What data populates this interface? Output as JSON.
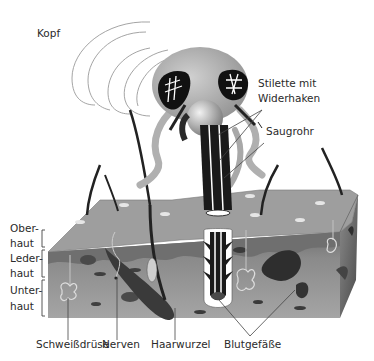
{
  "diagram": {
    "labels": {
      "head": "Kopf",
      "stylets": "Stilette mit Widerhaken",
      "stylets_line1": "Stilette mit",
      "stylets_line2": "Widerhaken",
      "proboscis": "Saugrohr",
      "epidermis_line1": "Ober-",
      "epidermis_line2": "haut",
      "dermis_line1": "Leder-",
      "dermis_line2": "haut",
      "subcutis_line1": "Unter-",
      "subcutis_line2": "haut",
      "sweat_gland": "Schweißdrüse",
      "nerves": "Nerven",
      "hair_root": "Haarwurzel",
      "blood_vessels": "Blutgefäße"
    },
    "colors": {
      "text": "#2a2a2a",
      "leader_line": "#444444",
      "skin_top": "#9a9a9a",
      "epidermis": "#7d7d7d",
      "dermis": "#8c8c8c",
      "subcutis": "#a8a8a8",
      "dark": "#1a1a1a",
      "mosquito_grey": "#b5b5b5"
    }
  }
}
